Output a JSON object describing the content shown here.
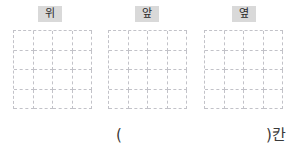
{
  "worksheet": {
    "views": [
      {
        "label": "위",
        "name": "top",
        "grid": {
          "rows": 4,
          "cols": 4
        }
      },
      {
        "label": "앞",
        "name": "front",
        "grid": {
          "rows": 4,
          "cols": 4
        }
      },
      {
        "label": "옆",
        "name": "side",
        "grid": {
          "rows": 4,
          "cols": 4
        }
      }
    ],
    "answer": {
      "open_paren": "(",
      "close_paren_unit": ")칸"
    },
    "colors": {
      "label_background": "#d9d9d9",
      "label_text": "#2b2b2b",
      "grid_line": "#c2c2c8",
      "answer_text": "#3a3a3a",
      "page_background": "#ffffff"
    }
  }
}
